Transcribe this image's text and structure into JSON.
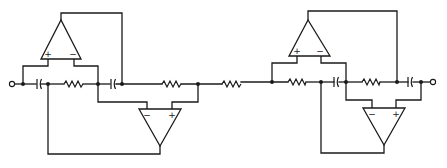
{
  "diagram": {
    "title": "",
    "colors": {
      "line": "#1a1a1a",
      "background": "#ffffff"
    },
    "opamps": [
      {
        "id": "U1",
        "orientation": "up",
        "plus_label": "+",
        "minus_label": "−"
      },
      {
        "id": "U2",
        "orientation": "down",
        "plus_label": "+",
        "minus_label": "−"
      },
      {
        "id": "U3",
        "orientation": "up",
        "plus_label": "+",
        "minus_label": "−"
      },
      {
        "id": "U4",
        "orientation": "down",
        "plus_label": "+",
        "minus_label": "−"
      }
    ],
    "components": {
      "resistors": 6,
      "capacitors": 4,
      "terminals": [
        "input",
        "output"
      ]
    }
  }
}
